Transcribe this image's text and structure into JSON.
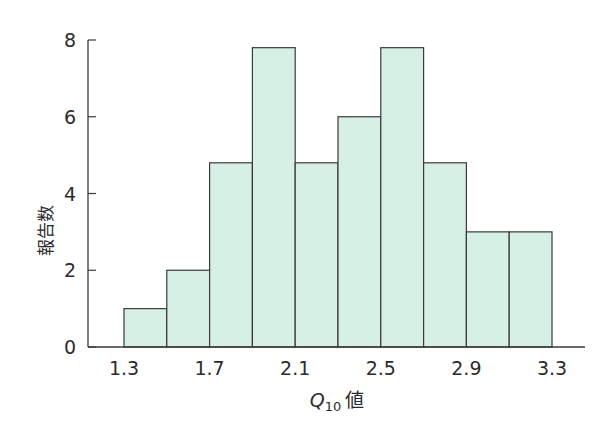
{
  "chart_data": {
    "type": "bar",
    "subtype": "histogram",
    "title": "",
    "xlabel": "Q10 値",
    "xlabel_parts": {
      "symbol": "Q",
      "subscript": "10",
      "suffix": "値"
    },
    "ylabel": "報告数",
    "bin_edges": [
      1.3,
      1.5,
      1.7,
      1.9,
      2.1,
      2.3,
      2.5,
      2.7,
      2.9,
      3.1,
      3.3
    ],
    "categories": [
      "1.3-1.5",
      "1.5-1.7",
      "1.7-1.9",
      "1.9-2.1",
      "2.1-2.3",
      "2.3-2.5",
      "2.5-2.7",
      "2.7-2.9",
      "2.9-3.1",
      "3.1-3.3"
    ],
    "values": [
      1,
      2,
      4.8,
      7.8,
      4.8,
      6,
      7.8,
      4.8,
      3,
      3
    ],
    "x_ticks": [
      "1.3",
      "1.7",
      "2.1",
      "2.5",
      "2.9",
      "3.3"
    ],
    "x_tick_values": [
      1.3,
      1.7,
      2.1,
      2.5,
      2.9,
      3.3
    ],
    "y_ticks": [
      "0",
      "2",
      "4",
      "6",
      "8"
    ],
    "y_tick_values": [
      0,
      2,
      4,
      6,
      8
    ],
    "ylim": [
      0,
      8
    ],
    "xlim": [
      1.1,
      3.5
    ],
    "grid": false,
    "legend": null,
    "colors": {
      "bar_fill": "#d6f0e5",
      "bar_edge": "#3a3a3a",
      "axis": "#3a3a3a"
    }
  }
}
